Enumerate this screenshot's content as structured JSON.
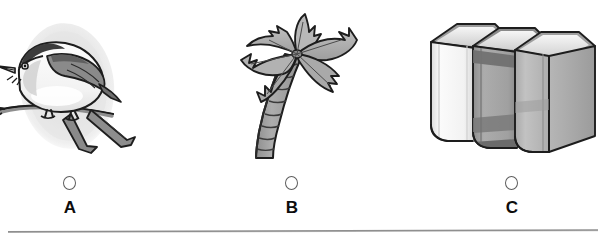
{
  "question": {
    "type": "multiple-choice-image",
    "background_color": "#ffffff",
    "choices": [
      {
        "letter": "A",
        "image_name": "bird-on-branch-illustration",
        "image_description": "Grayscale clip-art of a small perched bird on a branch over a light gray oval background",
        "selected": false,
        "radio_state": "unselected"
      },
      {
        "letter": "B",
        "image_name": "palm-tree-illustration",
        "image_description": "Grayscale clip-art of a palm tree with a curved ringed trunk and six fronds",
        "selected": false,
        "radio_state": "unselected"
      },
      {
        "letter": "C",
        "image_name": "stack-of-books-illustration",
        "image_description": "Grayscale clip-art of three hardcover books standing upright side by side",
        "selected": false,
        "radio_state": "unselected"
      }
    ],
    "divider": {
      "name": "horizontal-rule",
      "color": "#8f8f8f"
    }
  },
  "palette": {
    "outline": "#1a1a1a",
    "oval_backdrop": "#e9e9e9",
    "bird_body_light": "#f4f4f4",
    "bird_wing_mid": "#9c9c9c",
    "bird_wing_dark": "#6e6e6e",
    "palm_frond": "#b4b4b4",
    "palm_frond_shadow": "#9a9a9a",
    "palm_trunk": "#a2a2a2",
    "book_light": "#f0f0f0",
    "book_mid": "#a8a8a8",
    "book_dark": "#7d7d7d",
    "book_band": "#6f6f6f",
    "letter_color": "#0d0d0d",
    "radio_stroke": "#5d5d5d"
  }
}
